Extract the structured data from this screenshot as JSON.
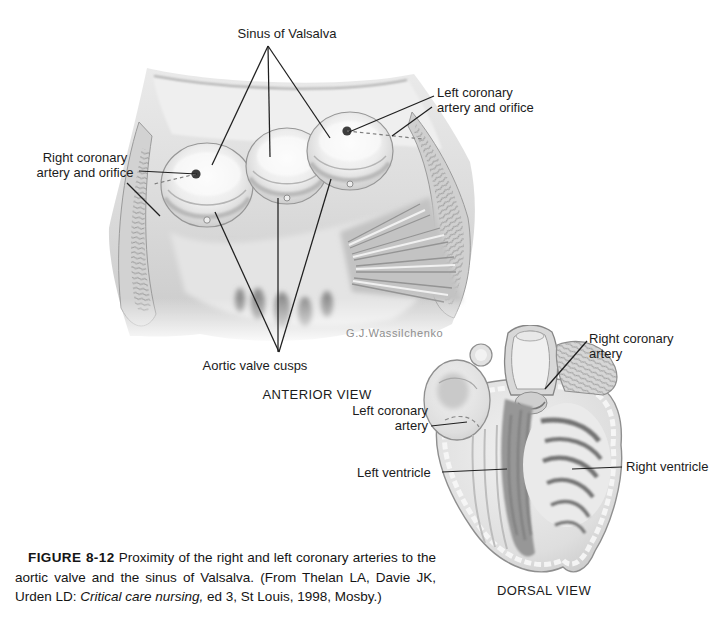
{
  "page": {
    "background_color": "#ffffff",
    "text_color": "#1b1b1b",
    "illustration_tone": "#d9d9d9"
  },
  "anterior": {
    "labels": {
      "sinus_of_valsalva": "Sinus of Valsalva",
      "right_coronary_orifice": "Right coronary\nartery and orifice",
      "left_coronary_orifice": "Left coronary\nartery and orifice",
      "aortic_valve_cusps": "Aortic valve cusps"
    },
    "view_title": "ANTERIOR VIEW",
    "artist_signature": "G.J.Wassilchenko"
  },
  "dorsal": {
    "labels": {
      "right_coronary_artery": "Right coronary\nartery",
      "left_coronary_artery": "Left coronary\nartery",
      "left_ventricle": "Left ventricle",
      "right_ventricle": "Right ventricle"
    },
    "view_title": "DORSAL VIEW"
  },
  "caption": {
    "figure_label": "FIGURE 8-12",
    "text_before_italic": " Proximity of the right and left coronary arteries to the aortic valve and the sinus of Valsalva. (From Thelan LA, Davie JK, Urden LD: ",
    "italic_text": "Critical care nursing,",
    "text_after_italic": " ed 3, St Louis, 1998, Mosby.)"
  }
}
